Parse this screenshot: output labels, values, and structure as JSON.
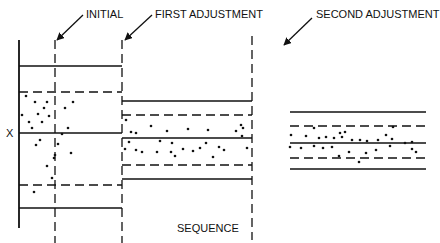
{
  "diagram": {
    "labels": {
      "initial": "INITIAL",
      "first": "FIRST ADJUSTMENT",
      "second": "SECOND ADJUSTMENT",
      "x_axis": "SEQUENCE",
      "y_axis": "X"
    },
    "colors": {
      "ink": "#111111",
      "background": "#ffffff"
    },
    "stages": [
      {
        "name": "initial",
        "x_start": 19,
        "x_end": 122,
        "ucl": 66,
        "upper_warn": 92,
        "center": 133,
        "lower_warn": 185,
        "lcl": 208,
        "points": [
          [
            22,
            115
          ],
          [
            26,
            96
          ],
          [
            29,
            122
          ],
          [
            32,
            128
          ],
          [
            35,
            102
          ],
          [
            38,
            114
          ],
          [
            40,
            140
          ],
          [
            42,
            122
          ],
          [
            44,
            108
          ],
          [
            47,
            102
          ],
          [
            49,
            116
          ],
          [
            47,
            166
          ],
          [
            58,
            144
          ],
          [
            62,
            134
          ],
          [
            65,
            108
          ],
          [
            68,
            128
          ],
          [
            71,
            153
          ],
          [
            73,
            102
          ],
          [
            54,
            158
          ],
          [
            34,
            192
          ],
          [
            52,
            178
          ],
          [
            36,
            145
          ],
          [
            55,
            155
          ]
        ]
      },
      {
        "name": "first",
        "x_start": 122,
        "x_end": 252,
        "ucl": 101,
        "upper_warn": 115,
        "center": 138,
        "lower_warn": 165,
        "lcl": 179,
        "points": [
          [
            126,
            120
          ],
          [
            131,
            132
          ],
          [
            136,
            133
          ],
          [
            151,
            126
          ],
          [
            167,
            131
          ],
          [
            171,
            152
          ],
          [
            183,
            149
          ],
          [
            188,
            129
          ],
          [
            193,
            151
          ],
          [
            200,
            148
          ],
          [
            206,
            143
          ],
          [
            208,
            130
          ],
          [
            213,
            157
          ],
          [
            219,
            147
          ],
          [
            236,
            131
          ],
          [
            241,
            125
          ],
          [
            243,
            128
          ],
          [
            242,
            136
          ],
          [
            247,
            148
          ],
          [
            172,
            143
          ],
          [
            129,
            142
          ],
          [
            136,
            150
          ],
          [
            142,
            152
          ],
          [
            175,
            156
          ],
          [
            157,
            152
          ],
          [
            160,
            141
          ],
          [
            125,
            149
          ],
          [
            224,
            150
          ]
        ]
      },
      {
        "name": "second",
        "x_start": 290,
        "x_end": 426,
        "ucl": 112,
        "upper_warn": 126,
        "center": 143,
        "lower_warn": 158,
        "lcl": 169,
        "points": [
          [
            291,
            135
          ],
          [
            306,
            136
          ],
          [
            314,
            128
          ],
          [
            319,
            138
          ],
          [
            326,
            137
          ],
          [
            334,
            138
          ],
          [
            342,
            137
          ],
          [
            340,
            133
          ],
          [
            345,
            132
          ],
          [
            352,
            140
          ],
          [
            360,
            140
          ],
          [
            367,
            141
          ],
          [
            378,
            140
          ],
          [
            392,
            139
          ],
          [
            393,
            127
          ],
          [
            405,
            143
          ],
          [
            412,
            142
          ],
          [
            412,
            149
          ],
          [
            390,
            146
          ],
          [
            376,
            150
          ],
          [
            366,
            153
          ],
          [
            332,
            147
          ],
          [
            323,
            148
          ],
          [
            314,
            146
          ],
          [
            301,
            148
          ],
          [
            290,
            147
          ],
          [
            386,
            135
          ],
          [
            359,
            162
          ],
          [
            339,
            156
          ],
          [
            416,
            152
          ],
          [
            349,
            152
          ]
        ]
      }
    ],
    "axis": {
      "x": 19,
      "y_top": 40,
      "y_bottom": 228
    },
    "adjustment_lines": [
      {
        "name": "initial-marker",
        "x": 55,
        "y_top": 40,
        "y_bottom": 243
      },
      {
        "name": "first-marker",
        "x": 122,
        "y_top": 40,
        "y_bottom": 243
      },
      {
        "name": "second-marker",
        "x": 252,
        "y_top": 36,
        "y_bottom": 240
      }
    ]
  }
}
